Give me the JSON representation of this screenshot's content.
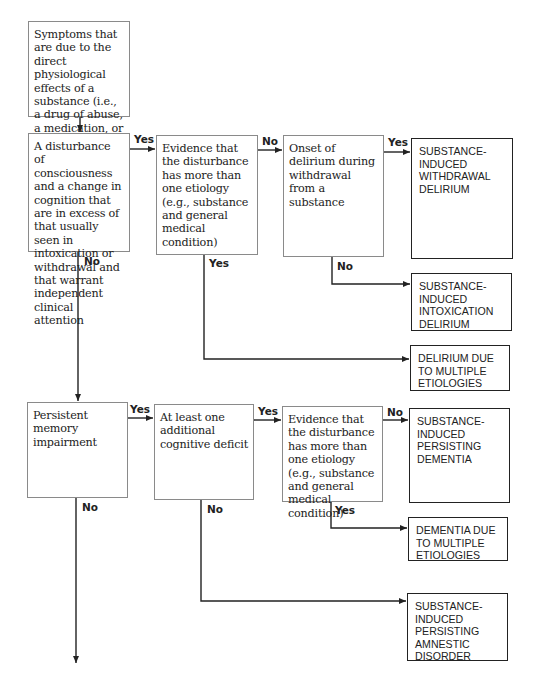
{
  "diagram": {
    "nodes": {
      "substance": {
        "text": "Symptoms that are due to the direct physiological effects of a substance (i.e., a drug of abuse, a medication, or a toxin)"
      },
      "disturbance": {
        "text": "A disturbance of consciousness and a change in cognition that are in excess of that usually seen in intoxication or withdrawal and that warrant independent clinical attention"
      },
      "evidence_delirium": {
        "text": "Evidence that the disturbance has more than one etiology (e.g., substance and general medical condition)"
      },
      "onset_withdrawal": {
        "text": "Onset of delirium during withdrawal from a substance"
      },
      "memory": {
        "text": "Persistent memory impairment"
      },
      "additional_deficit": {
        "text": "At least one additional cognitive deficit"
      },
      "evidence_dementia": {
        "text": "Evidence that the disturbance has more than one etiology (e.g., substance and general medical condition)"
      }
    },
    "outcomes": {
      "withdrawal_delirium": {
        "text": "SUBSTANCE-INDUCED WITHDRAWAL DELIRIUM"
      },
      "intoxication_delirium": {
        "text": "SUBSTANCE-INDUCED INTOXICATION DELIRIUM"
      },
      "delirium_multiple": {
        "text": "DELIRIUM DUE TO MULTIPLE ETIOLOGIES"
      },
      "persisting_dementia": {
        "text": "SUBSTANCE-INDUCED PERSISTING DEMENTIA"
      },
      "dementia_multiple": {
        "text": "DEMENTIA DUE TO MULTIPLE ETIOLOGIES"
      },
      "amnestic_disorder": {
        "text": "SUBSTANCE-INDUCED PERSISTING AMNESTIC DISORDER"
      }
    },
    "labels": {
      "yes": "Yes",
      "no": "No"
    },
    "colors": {
      "line": "#222222",
      "decision_border": "#8a8a8a",
      "outcome_border": "#222222"
    }
  }
}
